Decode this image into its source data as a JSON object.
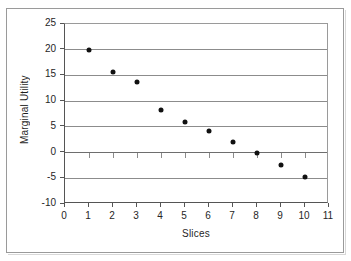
{
  "chart_data": {
    "type": "scatter",
    "title": "",
    "xlabel": "Slices",
    "ylabel": "Marginal Utility",
    "xlim": [
      0,
      11
    ],
    "ylim": [
      -10,
      25
    ],
    "x_ticks": [
      0,
      1,
      2,
      3,
      4,
      5,
      6,
      7,
      8,
      9,
      10,
      11
    ],
    "x_tick_labels": [
      "0",
      "1",
      "2",
      "3",
      "4",
      "5",
      "6",
      "7",
      "8",
      "9",
      "10",
      "11"
    ],
    "y_ticks": [
      -10,
      -5,
      0,
      5,
      10,
      15,
      20,
      25
    ],
    "y_tick_labels": [
      "-10",
      "-5",
      "0",
      "5",
      "10",
      "15",
      "20",
      "25"
    ],
    "grid": "horizontal",
    "legend": "none",
    "marker_color": "#111111",
    "gridline_color": "#8c8c8c",
    "axis_color": "#555555",
    "background_color": "#ffffff",
    "x": [
      1,
      2,
      3,
      4,
      5,
      6,
      7,
      8,
      9,
      10
    ],
    "y": [
      20,
      15.7,
      13.8,
      8.3,
      6.0,
      4.2,
      2.1,
      0,
      -2.5,
      -4.7
    ],
    "points": [
      {
        "x": 1,
        "y": 20
      },
      {
        "x": 2,
        "y": 15.7
      },
      {
        "x": 3,
        "y": 13.8
      },
      {
        "x": 4,
        "y": 8.3
      },
      {
        "x": 5,
        "y": 6.0
      },
      {
        "x": 6,
        "y": 4.2
      },
      {
        "x": 7,
        "y": 2.1
      },
      {
        "x": 8,
        "y": 0
      },
      {
        "x": 9,
        "y": -2.5
      },
      {
        "x": 10,
        "y": -4.7
      }
    ]
  }
}
